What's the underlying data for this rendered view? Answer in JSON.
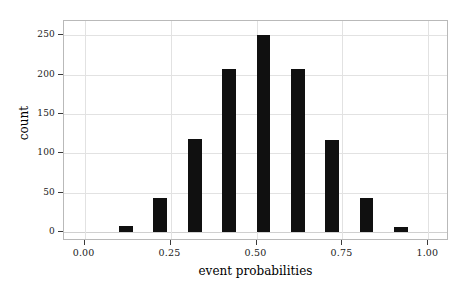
{
  "chart_data": {
    "type": "bar",
    "title": "",
    "subtitle": "",
    "xlabel": "event probabilities",
    "ylabel": "count",
    "x": [
      0.12,
      0.22,
      0.32,
      0.42,
      0.52,
      0.62,
      0.72,
      0.82,
      0.92
    ],
    "values": [
      8,
      44,
      118,
      207,
      250,
      207,
      117,
      43,
      7
    ],
    "categories": [
      "0.12",
      "0.22",
      "0.32",
      "0.42",
      "0.52",
      "0.62",
      "0.72",
      "0.82",
      "0.92"
    ],
    "bar_width": 0.04,
    "xlim": [
      -0.06,
      1.06
    ],
    "ylim": [
      -11,
      268
    ],
    "xticks": [
      0.0,
      0.25,
      0.5,
      0.75,
      1.0
    ],
    "xtick_labels": [
      "0.00",
      "0.25",
      "0.50",
      "0.75",
      "1.00"
    ],
    "yticks": [
      0,
      50,
      100,
      150,
      200,
      250
    ],
    "ytick_labels": [
      "0",
      "50",
      "100",
      "150",
      "200",
      "250"
    ],
    "grid": true,
    "legend": null,
    "colors": {
      "bar": "#101010",
      "grid": "#e2e2e2",
      "frame": "#b9b9b9",
      "text": "#1a1a1a",
      "background": "#ffffff"
    }
  }
}
